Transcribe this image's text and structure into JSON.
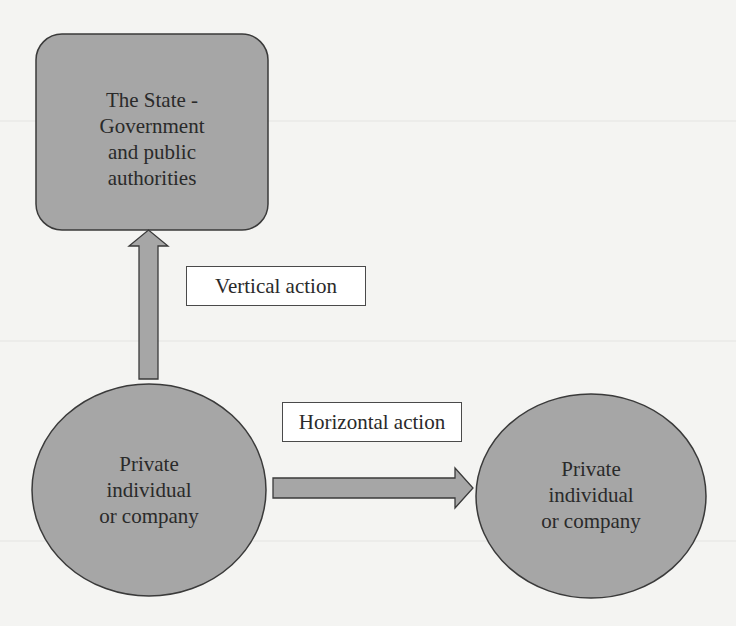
{
  "diagram": {
    "colors": {
      "shape_fill": "#a6a6a6",
      "shape_stroke": "#3a3a3a",
      "label_box_fill": "#ffffff",
      "background": "#f4f4f2"
    },
    "nodes": {
      "state": {
        "shape": "rounded-rectangle",
        "lines": [
          "The State -",
          "Government",
          "and public",
          "authorities"
        ]
      },
      "private_left": {
        "shape": "ellipse",
        "lines": [
          "Private",
          "individual",
          "or company"
        ]
      },
      "private_right": {
        "shape": "ellipse",
        "lines": [
          "Private",
          "individual",
          "or company"
        ]
      }
    },
    "edges": {
      "vertical": {
        "from": "private_left",
        "to": "state",
        "label": "Vertical action"
      },
      "horizontal": {
        "from": "private_left",
        "to": "private_right",
        "label": "Horizontal action"
      }
    }
  }
}
